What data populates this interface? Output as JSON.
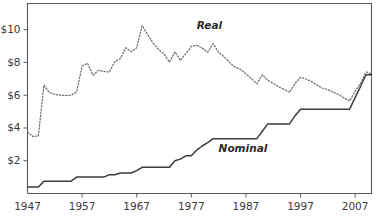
{
  "chart_data": {
    "type": "line",
    "title": "",
    "subtitle": "",
    "xlabel": "",
    "ylabel": "",
    "xlim": [
      1947,
      2010
    ],
    "ylim": [
      0,
      11.6
    ],
    "grid": false,
    "legend": "inline-annotations",
    "xticks": [
      1947,
      1957,
      1967,
      1977,
      1987,
      1997,
      2007
    ],
    "xticklabels": [
      "1947",
      "1957",
      "1967",
      "1977",
      "1987",
      "1997",
      "2007"
    ],
    "yticks": [
      2,
      4,
      6,
      8,
      10
    ],
    "yticklabels": [
      "$2",
      "$4",
      "$6",
      "$8",
      "$10"
    ],
    "annotations": [
      {
        "text": "Real",
        "x": 1978,
        "y": 10.05
      },
      {
        "text": "Nominal",
        "x": 1982,
        "y": 2.55
      }
    ],
    "x": [
      1947,
      1948,
      1949,
      1950,
      1951,
      1952,
      1953,
      1954,
      1955,
      1956,
      1957,
      1958,
      1959,
      1960,
      1961,
      1962,
      1963,
      1964,
      1965,
      1966,
      1967,
      1968,
      1969,
      1970,
      1971,
      1972,
      1973,
      1974,
      1975,
      1976,
      1977,
      1978,
      1979,
      1980,
      1981,
      1982,
      1983,
      1984,
      1985,
      1986,
      1987,
      1988,
      1989,
      1990,
      1991,
      1992,
      1993,
      1994,
      1995,
      1996,
      1997,
      1998,
      1999,
      2000,
      2001,
      2002,
      2003,
      2004,
      2005,
      2006,
      2007,
      2008,
      2009,
      2010
    ],
    "series": [
      {
        "name": "Nominal",
        "style": "solid",
        "values": [
          0.4,
          0.4,
          0.4,
          0.75,
          0.75,
          0.75,
          0.75,
          0.75,
          0.75,
          1.0,
          1.0,
          1.0,
          1.0,
          1.0,
          1.0,
          1.15,
          1.15,
          1.25,
          1.25,
          1.25,
          1.4,
          1.6,
          1.6,
          1.6,
          1.6,
          1.6,
          1.6,
          2.0,
          2.1,
          2.3,
          2.3,
          2.65,
          2.9,
          3.1,
          3.35,
          3.35,
          3.35,
          3.35,
          3.35,
          3.35,
          3.35,
          3.35,
          3.35,
          3.8,
          4.25,
          4.25,
          4.25,
          4.25,
          4.25,
          4.75,
          5.15,
          5.15,
          5.15,
          5.15,
          5.15,
          5.15,
          5.15,
          5.15,
          5.15,
          5.15,
          5.85,
          6.55,
          7.25,
          7.25
        ]
      },
      {
        "name": "Real",
        "style": "dotted",
        "values": [
          3.75,
          3.48,
          3.52,
          6.62,
          6.17,
          6.05,
          6.0,
          5.98,
          6.0,
          6.2,
          7.78,
          7.95,
          7.22,
          7.52,
          7.45,
          7.42,
          8.05,
          8.25,
          8.9,
          8.65,
          8.9,
          10.25,
          9.7,
          9.18,
          8.8,
          8.52,
          8.02,
          8.65,
          8.12,
          8.55,
          8.98,
          9.05,
          8.88,
          8.62,
          9.15,
          8.62,
          8.35,
          8.0,
          7.72,
          7.58,
          7.31,
          7.02,
          6.7,
          7.25,
          6.92,
          6.72,
          6.52,
          6.35,
          6.18,
          6.72,
          7.1,
          6.99,
          6.84,
          6.62,
          6.44,
          6.34,
          6.19,
          6.03,
          5.83,
          5.65,
          6.25,
          6.72,
          7.42,
          7.3
        ]
      }
    ]
  },
  "axes": {
    "y_tick_labels": [
      "$10",
      "$8",
      "$6",
      "$4",
      "$2"
    ],
    "x_tick_labels": [
      "1947",
      "1957",
      "1967",
      "1977",
      "1987",
      "1997",
      "2007"
    ]
  },
  "labels": {
    "real": "Real",
    "nominal": "Nominal"
  },
  "colors": {
    "nominal_line": "#3b3b3b",
    "real_line": "#6d6d6d",
    "axis": "#5a5a5a",
    "text": "#3a3a3a",
    "background": "#ffffff"
  }
}
